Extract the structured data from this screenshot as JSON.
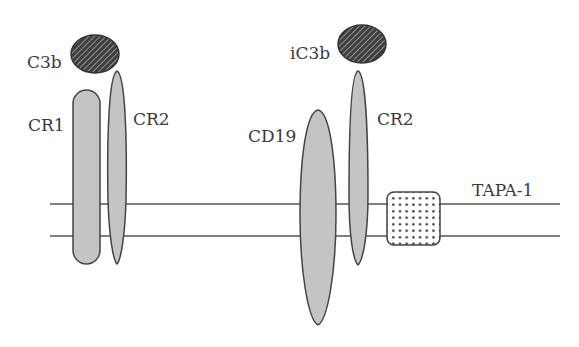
{
  "diagram": {
    "membrane": {
      "top_y": 204,
      "bottom_y": 236,
      "x_start": 50,
      "x_end": 560
    },
    "colors": {
      "protein_fill": "#c4c4c4",
      "outline": "#444444",
      "ligand_fill": "#3d3d3d",
      "membrane_line": "#555555"
    },
    "labels": {
      "c3b": "C3b",
      "cr1": "CR1",
      "cr2_left": "CR2",
      "ic3b": "iC3b",
      "cd19": "CD19",
      "cr2_right": "CR2",
      "tapa1": "TAPA-1"
    },
    "elements": [
      {
        "name": "C3b",
        "shape": "hatched-ellipse",
        "cx": 95,
        "cy": 54,
        "rx": 24,
        "ry": 19
      },
      {
        "name": "CR1",
        "shape": "rounded-rect",
        "x": 73,
        "y": 90,
        "w": 27,
        "h": 174
      },
      {
        "name": "CR2 (left)",
        "shape": "elongated-ellipse",
        "cx": 117,
        "top": 71,
        "bottom": 264
      },
      {
        "name": "iC3b",
        "shape": "hatched-ellipse",
        "cx": 362,
        "cy": 44,
        "rx": 24,
        "ry": 19
      },
      {
        "name": "CD19",
        "shape": "ellipse",
        "cx": 318,
        "top": 110,
        "bottom": 325
      },
      {
        "name": "CR2 (right)",
        "shape": "elongated-ellipse",
        "cx": 358,
        "top": 71,
        "bottom": 265
      },
      {
        "name": "TAPA-1",
        "shape": "dotted-rounded-square",
        "x": 387,
        "y": 192,
        "w": 53,
        "h": 53
      }
    ]
  }
}
